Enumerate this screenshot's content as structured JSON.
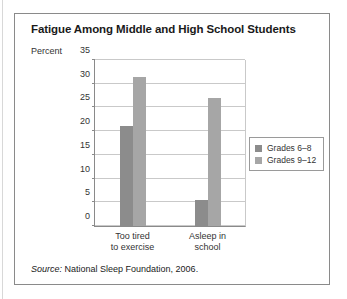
{
  "figure": {
    "title": "Fatigue Among Middle and High School Students",
    "unit_label": "Percent",
    "source_word": "Source:",
    "source_text": " National Sleep Foundation, 2006."
  },
  "chart_data": {
    "type": "bar",
    "title": "Fatigue Among Middle and High School Students",
    "xlabel": "",
    "ylabel": "Percent",
    "ylim": [
      0,
      35
    ],
    "yticks": [
      0,
      5,
      10,
      15,
      20,
      25,
      30,
      35
    ],
    "ytick_labels": [
      "0",
      "5",
      "10",
      "15",
      "20",
      "25",
      "30",
      "35"
    ],
    "grid": true,
    "legend_position": "right",
    "categories": [
      "Too tired to exercise",
      "Asleep in school"
    ],
    "category_lines": [
      [
        "Too tired",
        "to exercise"
      ],
      [
        "Asleep in",
        "school"
      ]
    ],
    "series": [
      {
        "name": "Grades 6–8",
        "color": "#8c8c8c",
        "values": [
          21,
          5.5
        ]
      },
      {
        "name": "Grades 9–12",
        "color": "#a6a6a6",
        "values": [
          31.5,
          27
        ]
      }
    ],
    "source": "Source: National Sleep Foundation, 2006."
  }
}
